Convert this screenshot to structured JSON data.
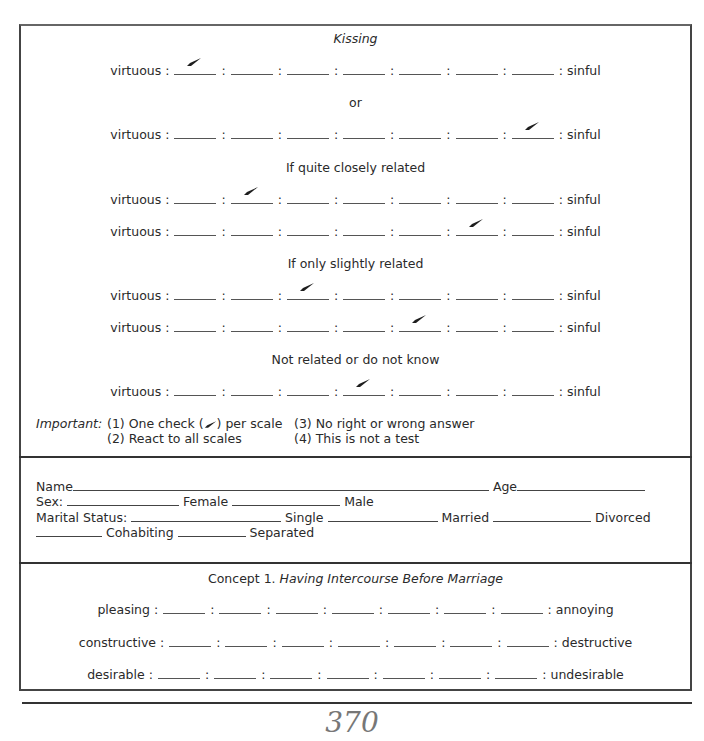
{
  "section1": {
    "title": "Kissing",
    "left_anchor": "virtuous",
    "right_anchor": "sinful",
    "groups": [
      {
        "heading": "",
        "rows": [
          {
            "checked_position": 1
          }
        ]
      },
      {
        "heading": "or",
        "rows": [
          {
            "checked_position": 7
          }
        ]
      },
      {
        "heading": "If quite closely related",
        "rows": [
          {
            "checked_position": 2
          },
          {
            "checked_position": 6
          }
        ]
      },
      {
        "heading": "If only slightly related",
        "rows": [
          {
            "checked_position": 3
          },
          {
            "checked_position": 5
          }
        ]
      },
      {
        "heading": "Not related or do not know",
        "rows": [
          {
            "checked_position": 4
          }
        ]
      }
    ],
    "important": {
      "label": "Important:",
      "items": [
        "(1) One check (",
        ") per scale",
        "(2) React to all scales",
        "(3) No right or wrong answer",
        "(4) This is not a test"
      ]
    }
  },
  "demographics": {
    "name_label": "Name",
    "age_label": "Age",
    "sex_label": "Sex:",
    "female_label": "Female",
    "male_label": "Male",
    "marital_label": "Marital Status:",
    "single_label": "Single",
    "married_label": "Married",
    "divorced_label": "Divorced",
    "cohabiting_label": "Cohabiting",
    "separated_label": "Separated"
  },
  "concept": {
    "prefix": "Concept 1.",
    "title": "Having Intercourse Before Marriage",
    "scales": [
      {
        "left": "pleasing",
        "right": "annoying"
      },
      {
        "left": "constructive",
        "right": "destructive"
      },
      {
        "left": "desirable",
        "right": "undesirable"
      }
    ]
  },
  "footer": {
    "page_number": "370"
  }
}
